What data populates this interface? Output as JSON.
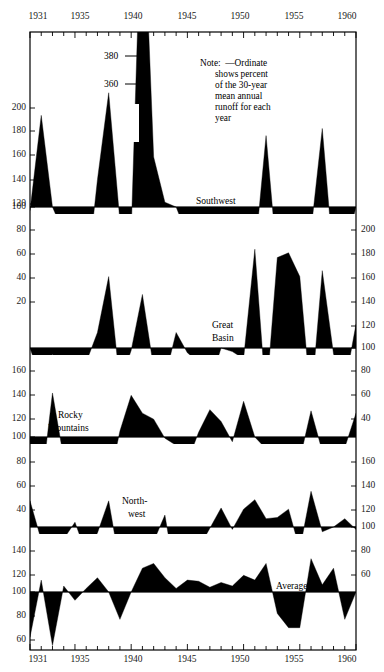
{
  "chart_data": {
    "type": "area",
    "title": "",
    "xlabel": "",
    "ylabel": "",
    "grid": false,
    "legend_position": "inline-panel-labels",
    "x": [
      1931,
      1932,
      1933,
      1934,
      1935,
      1936,
      1937,
      1938,
      1939,
      1940,
      1941,
      1942,
      1943,
      1944,
      1945,
      1946,
      1947,
      1948,
      1949,
      1950,
      1951,
      1952,
      1953,
      1954,
      1955,
      1956,
      1957,
      1958,
      1959,
      1960
    ],
    "x_tick_labels": [
      "1931",
      "1935",
      "1940",
      "1945",
      "1950",
      "1955",
      "1960"
    ],
    "x_tick_values": [
      1931,
      1935,
      1940,
      1945,
      1950,
      1955,
      1960
    ],
    "baseline": 100,
    "units": "percent of 30-year mean annual runoff",
    "annotations": [
      {
        "text": "Note:  —Ordinate",
        "x": 1948,
        "y": 300
      },
      {
        "text": "shows percent",
        "x": 1948,
        "y": 285
      },
      {
        "text": "of the 30-year",
        "x": 1948,
        "y": 270
      },
      {
        "text": "mean annual",
        "x": 1948,
        "y": 255
      },
      {
        "text": "runoff for each",
        "x": 1948,
        "y": 240
      },
      {
        "text": "year",
        "x": 1948,
        "y": 225
      },
      {
        "text": "380",
        "x": 1938,
        "y": 380
      },
      {
        "text": "360",
        "x": 1938,
        "y": 360
      }
    ],
    "series": [
      {
        "name": "Southwest",
        "label": "Southwest",
        "ylim": [
          90,
          215
        ],
        "y_ticks_left": [
          20,
          40,
          60,
          80,
          100,
          120,
          140,
          160,
          180,
          200
        ],
        "y_ticks_right": [],
        "clip_max": 215,
        "values": [
          97,
          177,
          100,
          78,
          93,
          36,
          123,
          196,
          88,
          78,
          380,
          142,
          104,
          100,
          76,
          61,
          55,
          52,
          66,
          47,
          60,
          160,
          53,
          62,
          70,
          80,
          166,
          54,
          62,
          100
        ]
      },
      {
        "name": "Great Basin",
        "label": "Great\nBasin",
        "ylim": [
          90,
          215
        ],
        "y_ticks_left": [
          20,
          40,
          60,
          80,
          100,
          120,
          140,
          160,
          180,
          200
        ],
        "y_ticks_right": [
          100,
          120,
          140,
          160,
          180,
          200
        ],
        "clip_max": 215,
        "values": [
          100,
          72,
          95,
          70,
          77,
          88,
          113,
          160,
          70,
          98,
          145,
          83,
          75,
          113,
          96,
          88,
          70,
          100,
          97,
          91,
          183,
          57,
          176,
          180,
          160,
          54,
          165,
          95,
          68,
          120
        ]
      },
      {
        "name": "Rocky Mountains",
        "label": "Rocky\nMountains",
        "ylim": [
          90,
          180
        ],
        "y_ticks_left": [
          40,
          60,
          80,
          100,
          120,
          140,
          160
        ],
        "y_ticks_right": [
          40,
          60,
          80,
          100,
          120,
          140,
          160
        ],
        "clip_max": 180,
        "values": [
          85,
          58,
          137,
          82,
          86,
          86,
          87,
          61,
          105,
          135,
          120,
          115,
          99,
          93,
          79,
          104,
          123,
          113,
          96,
          130,
          100,
          90,
          75,
          83,
          81,
          122,
          88,
          70,
          91,
          120
        ]
      },
      {
        "name": "Northwest",
        "label": "North-\nwest",
        "ylim": [
          90,
          180
        ],
        "y_ticks_left": [
          40,
          60,
          80,
          100,
          120,
          140,
          160
        ],
        "y_ticks_right": [
          60,
          80,
          100,
          120
        ],
        "clip_max": 180,
        "values": [
          122,
          89,
          75,
          90,
          104,
          78,
          95,
          122,
          68,
          82,
          78,
          88,
          110,
          55,
          76,
          82,
          99,
          116,
          98,
          115,
          123,
          107,
          108,
          115,
          81,
          130,
          96,
          100,
          107,
          98
        ]
      },
      {
        "name": "Average",
        "label": "Average",
        "ylim": [
          50,
          135
        ],
        "y_ticks_left": [
          60,
          80,
          100,
          120,
          140
        ],
        "y_ticks_right": [
          60,
          80,
          100,
          120
        ],
        "clip_max": 135,
        "values": [
          62,
          110,
          55,
          105,
          93,
          103,
          112,
          100,
          77,
          100,
          120,
          124,
          112,
          103,
          110,
          109,
          104,
          108,
          105,
          114,
          110,
          124,
          82,
          70,
          70,
          128,
          106,
          120,
          77,
          100
        ]
      }
    ]
  },
  "axes": {
    "top_years": [
      "1931",
      "1935",
      "1940",
      "1945",
      "1950",
      "1955",
      "1960"
    ],
    "bottom_years": [
      "1931",
      "1935",
      "1940",
      "1945",
      "1950",
      "1955",
      "1960"
    ],
    "left_ticks": [
      {
        "v": "200",
        "y": 108
      },
      {
        "v": "180",
        "y": 131
      },
      {
        "v": "160",
        "y": 155
      },
      {
        "v": "140",
        "y": 180
      },
      {
        "v": "120",
        "y": 204
      },
      {
        "v": "100",
        "y": 207
      },
      {
        "v": "80",
        "y": 230
      },
      {
        "v": "60",
        "y": 254
      },
      {
        "v": "40",
        "y": 278
      },
      {
        "v": "20",
        "y": 302
      },
      {
        "v": "160",
        "y": 371
      },
      {
        "v": "140",
        "y": 395
      },
      {
        "v": "120",
        "y": 419
      },
      {
        "v": "100",
        "y": 437
      },
      {
        "v": "80",
        "y": 462
      },
      {
        "v": "60",
        "y": 486
      },
      {
        "v": "40",
        "y": 510
      },
      {
        "v": "140",
        "y": 551
      },
      {
        "v": "120",
        "y": 575
      },
      {
        "v": "100",
        "y": 592
      },
      {
        "v": "80",
        "y": 616
      },
      {
        "v": "60",
        "y": 640
      }
    ],
    "right_ticks": [
      {
        "v": "200",
        "y": 230
      },
      {
        "v": "180",
        "y": 254
      },
      {
        "v": "160",
        "y": 278
      },
      {
        "v": "140",
        "y": 302
      },
      {
        "v": "120",
        "y": 326
      },
      {
        "v": "100",
        "y": 348
      },
      {
        "v": "80",
        "y": 371
      },
      {
        "v": "60",
        "y": 395
      },
      {
        "v": "40",
        "y": 419
      },
      {
        "v": "160",
        "y": 462
      },
      {
        "v": "140",
        "y": 486
      },
      {
        "v": "120",
        "y": 510
      },
      {
        "v": "100",
        "y": 527
      },
      {
        "v": "80",
        "y": 551
      },
      {
        "v": "60",
        "y": 575
      }
    ]
  },
  "labels": {
    "southwest": "Southwest",
    "great_basin_l1": "Great",
    "great_basin_l2": "Basin",
    "rocky_l1": "Rocky",
    "rocky_l2": "Mountains",
    "northwest_l1": "North-",
    "northwest_l2": "west",
    "average": "Average",
    "note_l1": "Note:  —Ordinate",
    "note_l2": "shows percent",
    "note_l3": "of the 30-year",
    "note_l4": "mean annual",
    "note_l5": "runoff for each",
    "note_l6": "year",
    "callout_380": "380",
    "callout_360": "360"
  },
  "colors": {
    "ink": "#000000",
    "background": "#ffffff",
    "frame": "#000000"
  }
}
